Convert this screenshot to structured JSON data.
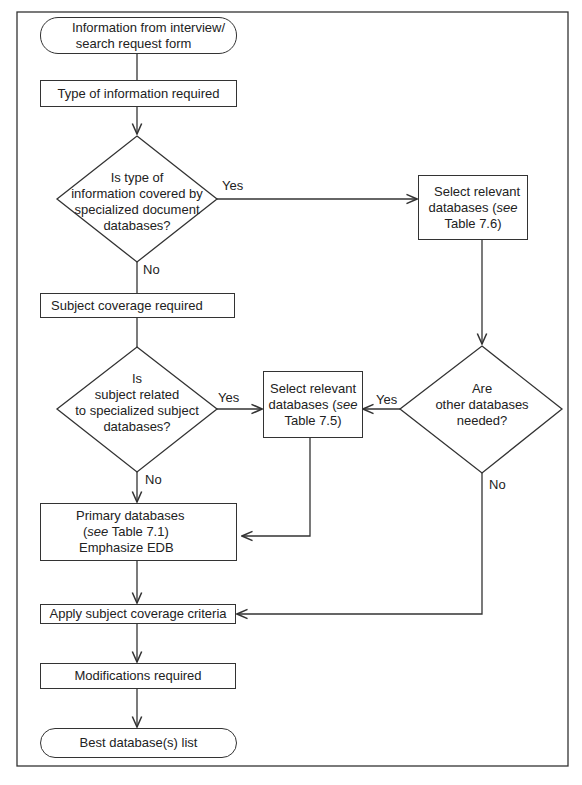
{
  "diagram": {
    "nodes": {
      "start": {
        "type": "terminal",
        "line1": "Information from interview/",
        "line2": "search request form"
      },
      "type_info": {
        "type": "process",
        "label": "Type of information required"
      },
      "decision_doc": {
        "type": "decision",
        "line1": "Is type of",
        "line2": "information covered by",
        "line3": "specialized document",
        "line4": "databases?"
      },
      "select_76": {
        "type": "process",
        "line1": "Select relevant",
        "line2a": "databases (",
        "line2b": "see",
        "line3": "Table 7.6)"
      },
      "subject_cov": {
        "type": "process",
        "label": "Subject coverage required"
      },
      "decision_subj": {
        "type": "decision",
        "line1": "Is",
        "line2": "subject related",
        "line3": "to specialized subject",
        "line4": "databases?"
      },
      "select_75": {
        "type": "process",
        "line1": "Select relevant",
        "line2a": "databases (",
        "line2b": "see",
        "line3": "Table 7.5)"
      },
      "decision_other": {
        "type": "decision",
        "line1": "Are",
        "line2": "other databases",
        "line3": "needed?"
      },
      "primary": {
        "type": "process",
        "line1": "Primary databases",
        "line2a": "(",
        "line2b": "see",
        "line2c": " Table 7.1)",
        "line3": "Emphasize EDB"
      },
      "apply": {
        "type": "process",
        "label": "Apply subject coverage criteria"
      },
      "modifications": {
        "type": "process",
        "label": "Modifications required"
      },
      "end": {
        "type": "terminal",
        "label": "Best database(s) list"
      }
    },
    "edge_labels": {
      "doc_yes": "Yes",
      "doc_no": "No",
      "subj_yes": "Yes",
      "subj_no": "No",
      "other_yes": "Yes",
      "other_no": "No"
    },
    "edges": [
      {
        "from": "start",
        "to": "type_info"
      },
      {
        "from": "type_info",
        "to": "decision_doc"
      },
      {
        "from": "decision_doc",
        "to": "select_76",
        "label": "Yes"
      },
      {
        "from": "decision_doc",
        "to": "subject_cov",
        "label": "No"
      },
      {
        "from": "select_76",
        "to": "decision_other"
      },
      {
        "from": "subject_cov",
        "to": "decision_subj"
      },
      {
        "from": "decision_subj",
        "to": "select_75",
        "label": "Yes"
      },
      {
        "from": "decision_subj",
        "to": "primary",
        "label": "No"
      },
      {
        "from": "decision_other",
        "to": "select_75",
        "label": "Yes"
      },
      {
        "from": "decision_other",
        "to": "apply",
        "label": "No"
      },
      {
        "from": "select_75",
        "to": "primary"
      },
      {
        "from": "primary",
        "to": "apply"
      },
      {
        "from": "apply",
        "to": "modifications"
      },
      {
        "from": "modifications",
        "to": "end"
      }
    ]
  }
}
